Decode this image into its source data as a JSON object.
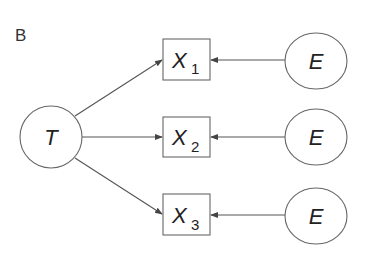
{
  "panel_label": "B",
  "nodes": {
    "T": {
      "label": "T",
      "shape": "ellipse"
    },
    "X1": {
      "label": "X",
      "subscript": "1",
      "shape": "rect"
    },
    "X2": {
      "label": "X",
      "subscript": "2",
      "shape": "rect"
    },
    "X3": {
      "label": "X",
      "subscript": "3",
      "shape": "rect"
    },
    "E1": {
      "label": "E",
      "shape": "ellipse"
    },
    "E2": {
      "label": "E",
      "shape": "ellipse"
    },
    "E3": {
      "label": "E",
      "shape": "ellipse"
    }
  },
  "edges": [
    {
      "from": "T",
      "to": "X1"
    },
    {
      "from": "T",
      "to": "X2"
    },
    {
      "from": "T",
      "to": "X3"
    },
    {
      "from": "E1",
      "to": "X1"
    },
    {
      "from": "E2",
      "to": "X2"
    },
    {
      "from": "E3",
      "to": "X3"
    }
  ],
  "colors": {
    "stroke": "#555555",
    "text": "#222222",
    "background": "#ffffff"
  }
}
